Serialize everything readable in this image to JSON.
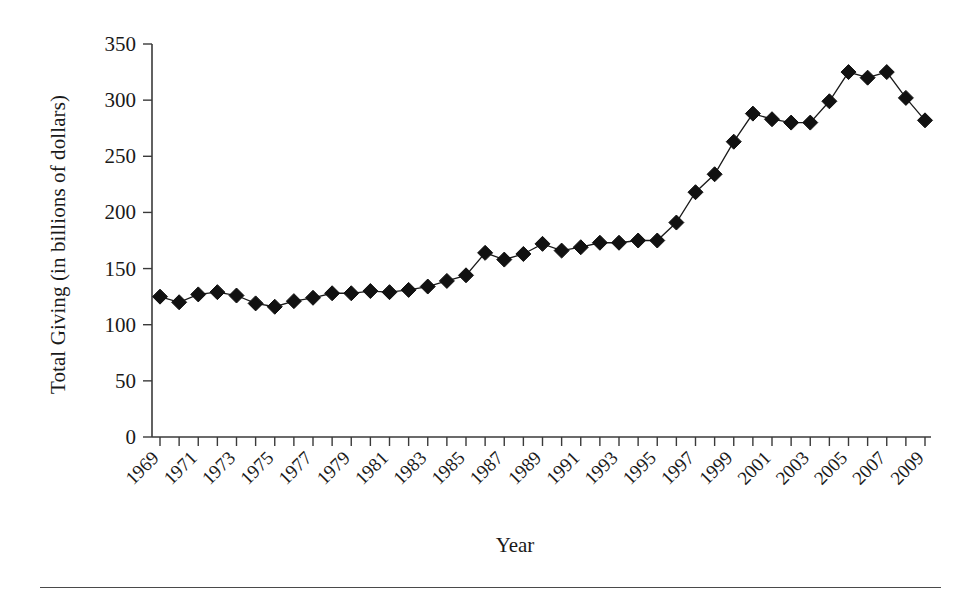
{
  "chart_data": {
    "type": "line",
    "title": "",
    "xlabel": "Year",
    "ylabel": "Total Giving (in billions of dollars)",
    "xlim": [
      1969,
      2009
    ],
    "ylim": [
      0,
      350
    ],
    "yticks": [
      0,
      50,
      100,
      150,
      200,
      250,
      300,
      350
    ],
    "ytick_labels": [
      "0",
      "50",
      "100",
      "150",
      "200",
      "250",
      "300",
      "350"
    ],
    "xtick_labels": [
      "1969",
      "1971",
      "1973",
      "1975",
      "1977",
      "1979",
      "1981",
      "1983",
      "1985",
      "1987",
      "1989",
      "1991",
      "1993",
      "1995",
      "1997",
      "1999",
      "2001",
      "2003",
      "2005",
      "2007",
      "2009"
    ],
    "xtick_rotation_deg": 45,
    "grid": false,
    "legend": false,
    "legend_position": "none",
    "marker": "diamond",
    "marker_color": "#111111",
    "line_color": "#1a1a1a",
    "x": [
      1969,
      1970,
      1971,
      1972,
      1973,
      1974,
      1975,
      1976,
      1977,
      1978,
      1979,
      1980,
      1981,
      1982,
      1983,
      1984,
      1985,
      1986,
      1987,
      1988,
      1989,
      1990,
      1991,
      1992,
      1993,
      1994,
      1995,
      1996,
      1997,
      1998,
      1999,
      2000,
      2001,
      2002,
      2003,
      2004,
      2005,
      2006,
      2007,
      2008,
      2009
    ],
    "values": [
      125,
      120,
      127,
      129,
      126,
      119,
      116,
      121,
      124,
      128,
      128,
      130,
      129,
      131,
      134,
      139,
      144,
      164,
      158,
      163,
      172,
      166,
      169,
      173,
      173,
      175,
      175,
      191,
      218,
      234,
      263,
      288,
      283,
      280,
      280,
      299,
      325,
      320,
      325,
      302,
      282
    ]
  },
  "figure": {
    "bottom_rule": true
  }
}
